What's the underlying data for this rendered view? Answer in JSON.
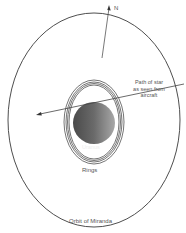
{
  "diagram": {
    "labels": {
      "north": "N",
      "star_path_line1": "Path of star",
      "star_path_line2": "as seen from",
      "star_path_line3": "aircraft",
      "planet": "Uranus",
      "rings": "Rings",
      "orbit": "Orbit of Miranda"
    },
    "colors": {
      "line": "#3a3a3a",
      "planet_dark": "#555555",
      "planet_light": "#9a9a9a",
      "text": "#555555"
    }
  }
}
